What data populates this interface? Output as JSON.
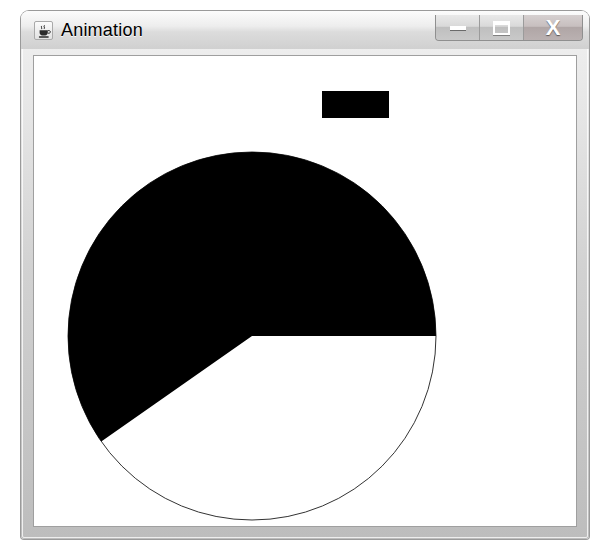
{
  "window": {
    "title": "Animation",
    "app_icon": "java-coffee-cup-icon",
    "controls": {
      "minimize_label": "—",
      "maximize_label": "□",
      "close_label": "X"
    }
  },
  "canvas": {
    "background_color": "#ffffff",
    "shape_color": "#000000",
    "outline_color": "#333333",
    "rectangle": {
      "name": "black-rectangle",
      "x": 288,
      "y": 35,
      "width": 67,
      "height": 27
    },
    "pie": {
      "name": "pie-chart",
      "center_x": 218,
      "center_y": 280,
      "radius": 184,
      "start_angle_deg": 0,
      "sweep_angle_deg": 215,
      "filled_fraction_percent": 60
    }
  }
}
